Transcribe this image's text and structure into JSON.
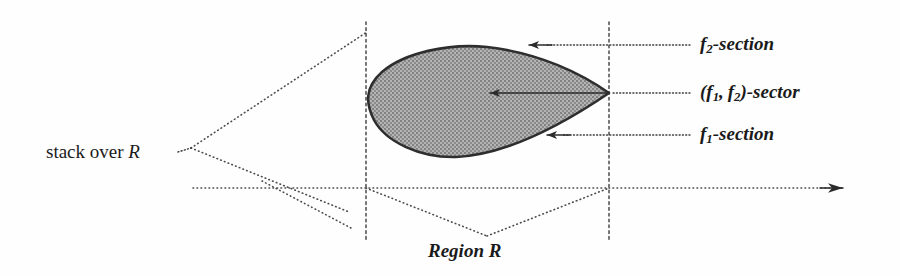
{
  "figure": {
    "background_color": "#fefefe",
    "ink_color": "#2e2e2e",
    "shade_color": "#9e9e9e"
  },
  "labels": {
    "stack_over_r": "stack over R",
    "stack_over_r_plain": "stack over",
    "stack_over_r_var": "R",
    "region_r": "Region R",
    "f2_section": "f2-section",
    "f1_f2_sector": "(f1, f2)-sector",
    "f1_section": "f1-section"
  },
  "callouts": [
    {
      "id": "f2-section",
      "label": "f2-section",
      "arrow_tip": [
        527,
        45
      ],
      "arrow_tail": [
        690,
        45
      ],
      "style": "dotted"
    },
    {
      "id": "f1-f2-sector",
      "label": "(f1, f2)-sector",
      "arrow_tip": [
        487,
        93
      ],
      "arrow_tail": [
        690,
        93
      ],
      "style": "solid-then-dotted"
    },
    {
      "id": "f1-section",
      "label": "f1-section",
      "arrow_tip": [
        545,
        135
      ],
      "arrow_tail": [
        690,
        135
      ],
      "style": "dotted"
    }
  ],
  "geometry": {
    "axis": {
      "start": [
        193,
        188
      ],
      "end": [
        858,
        188
      ],
      "has_arrowhead": true,
      "style": "dotted"
    },
    "vertical_guides": [
      {
        "x": 366,
        "y_top": 22,
        "y_bottom": 240,
        "style": "dashed"
      },
      {
        "x": 609,
        "y_top": 22,
        "y_bottom": 240,
        "style": "dashed"
      }
    ],
    "cone_apex": [
      191,
      148
    ],
    "cone_upper_ray_end": [
      366,
      32
    ],
    "cone_lower_ray_end": [
      366,
      210
    ],
    "region_v_left": [
      366,
      188
    ],
    "region_v_vertex": [
      487,
      236
    ],
    "region_v_right": [
      609,
      188
    ],
    "lower_diagonal_start": [
      278,
      188
    ],
    "lower_diagonal_end": [
      348,
      226
    ],
    "blob_tip": [
      609,
      93
    ],
    "blob_top": [
      441,
      47
    ],
    "blob_bottom": [
      452,
      158
    ],
    "blob_left": [
      368,
      108
    ]
  }
}
